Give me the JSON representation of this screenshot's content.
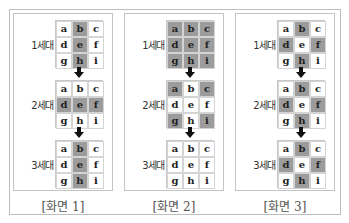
{
  "colors": {
    "on": "#9c9c9c",
    "off": "#ffffff",
    "border": "#c4c4c4"
  },
  "letters": [
    "a",
    "b",
    "c",
    "d",
    "e",
    "f",
    "g",
    "h",
    "i"
  ],
  "panels": [
    {
      "caption": "[화면 1]",
      "generations": [
        {
          "label": "1세대",
          "on": [
            1,
            4,
            7
          ]
        },
        {
          "label": "2세대",
          "on": [
            3,
            4,
            5
          ]
        },
        {
          "label": "3세대",
          "on": [
            1,
            4,
            7
          ]
        }
      ]
    },
    {
      "caption": "[화면 2]",
      "generations": [
        {
          "label": "1세대",
          "on": [
            0,
            1,
            2,
            3,
            4,
            5,
            6,
            7,
            8
          ]
        },
        {
          "label": "2세대",
          "on": [
            0,
            2,
            6,
            8
          ]
        },
        {
          "label": "3세대",
          "on": []
        }
      ]
    },
    {
      "caption": "[화면 3]",
      "generations": [
        {
          "label": "1세대",
          "on": [
            1,
            3,
            5,
            7
          ]
        },
        {
          "label": "2세대",
          "on": [
            1,
            3,
            5,
            7
          ]
        },
        {
          "label": "3세대",
          "on": [
            1,
            3,
            5,
            7
          ]
        }
      ]
    }
  ],
  "arrow_icon": "down-arrow-icon"
}
